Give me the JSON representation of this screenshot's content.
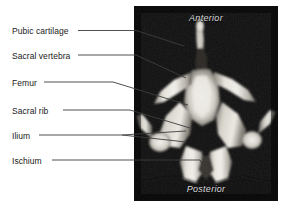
{
  "figure": {
    "background_color": "#ffffff",
    "photo": {
      "name": "anatomical-specimen-photo",
      "background_color": "#0a0a0a",
      "bone_color": "#e8e6e0",
      "orientation_markers": [
        {
          "id": "anterior",
          "text": "Anterior",
          "position": "top-center"
        },
        {
          "id": "posterior",
          "text": "Posterior",
          "position": "bottom-center"
        }
      ]
    },
    "annotations": [
      {
        "id": "pubic-cartilage",
        "text": "Pubic cartilage",
        "label_x": 12,
        "label_y": 33,
        "leader": "M 78 30.5 L 136 30.5 L 184 46"
      },
      {
        "id": "sacral-vertebra",
        "text": "Sacral vertebra",
        "label_x": 12,
        "label_y": 58,
        "leader": "M 78 55 L 136 55 L 186 78"
      },
      {
        "id": "femur",
        "text": "Femur",
        "label_x": 12,
        "label_y": 85,
        "leader": "M 44 82 L 113 82 L 188 105"
      },
      {
        "id": "sacral-rib",
        "text": "Sacral rib",
        "label_x": 12,
        "label_y": 113,
        "leader": "M 63 110 L 130 110 L 190 128"
      },
      {
        "id": "ilium",
        "text": "Ilium",
        "label_x": 12,
        "label_y": 138,
        "leader": "M 39 135 L 122 135 L 186 131 M 122 135 L 186 142"
      },
      {
        "id": "ischium",
        "text": "Ischium",
        "label_x": 12,
        "label_y": 163,
        "leader": "M 52 160 L 200 160 L 206 172"
      }
    ]
  }
}
